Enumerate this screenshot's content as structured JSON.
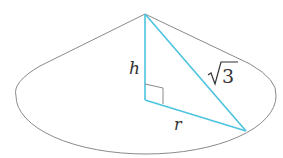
{
  "figure": {
    "labels": {
      "height": "h",
      "radius": "r",
      "slant": "3",
      "slant_radical": "√"
    },
    "colors": {
      "outline": "#8a8a8a",
      "triangle": "#4cc3df",
      "text": "#333333"
    }
  }
}
